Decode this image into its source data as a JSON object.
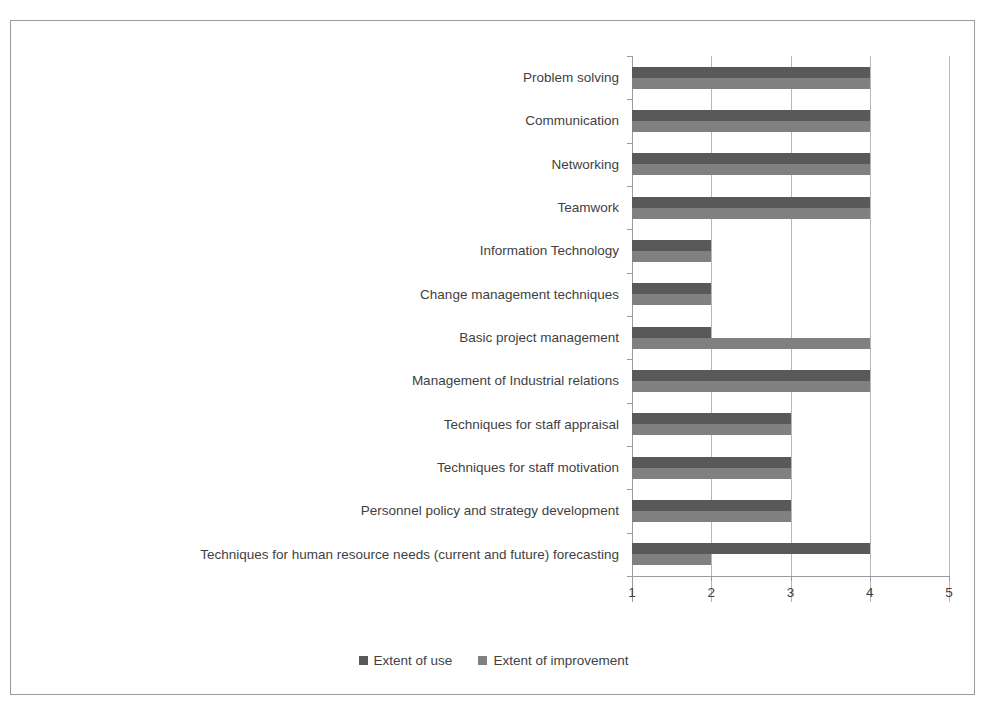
{
  "chart_data": {
    "type": "bar",
    "orientation": "horizontal",
    "title": "",
    "subtitle": "",
    "xlabel": "",
    "ylabel": "",
    "xlim": [
      1,
      5
    ],
    "xticks": [
      "1",
      "2",
      "3",
      "4",
      "5"
    ],
    "grid": true,
    "legend_position": "bottom",
    "categories": [
      "Problem solving",
      "Communication",
      "Networking",
      "Teamwork",
      "Information Technology",
      "Change management techniques",
      "Basic project management",
      "Management of Industrial relations",
      "Techniques for staff appraisal",
      "Techniques for staff motivation",
      "Personnel policy and strategy development",
      "Techniques for human resource needs (current and future) forecasting"
    ],
    "series": [
      {
        "name": "Extent of use",
        "color": "#595959",
        "values": [
          4,
          4,
          4,
          4,
          2,
          2,
          2,
          4,
          3,
          3,
          3,
          4
        ]
      },
      {
        "name": "Extent of improvement",
        "color": "#808080",
        "values": [
          4,
          4,
          4,
          4,
          2,
          2,
          4,
          4,
          3,
          3,
          3,
          2
        ]
      }
    ]
  },
  "legend": {
    "items": [
      {
        "label": "Extent of use"
      },
      {
        "label": "Extent of improvement"
      }
    ]
  },
  "axis": {
    "x_tick_labels": [
      "1",
      "2",
      "3",
      "4",
      "5"
    ]
  }
}
